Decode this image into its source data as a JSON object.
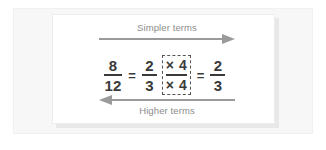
{
  "figure": {
    "top_arrow": {
      "label": "Simpler terms",
      "direction": "right",
      "icon": "arrow-right-icon"
    },
    "bottom_arrow": {
      "label": "Higher terms",
      "direction": "left",
      "icon": "arrow-left-icon"
    },
    "equation": {
      "left_fraction": {
        "numerator": "8",
        "denominator": "12"
      },
      "first_equals": "=",
      "middle_fraction": {
        "numerator": "2",
        "denominator": "3"
      },
      "multiplier": {
        "numerator_operator": "×",
        "numerator_value": "4",
        "denominator_operator": "×",
        "denominator_value": "4"
      },
      "second_equals": "=",
      "right_fraction": {
        "numerator": "2",
        "denominator": "3"
      }
    },
    "colors": {
      "arrow": "#9a9a9a",
      "label_text": "#8c8c8c",
      "equation_text": "#3a3a3a",
      "dashed_box": "#555555",
      "card_background": "#ffffff",
      "frame_background": "#f7f7f7"
    }
  }
}
